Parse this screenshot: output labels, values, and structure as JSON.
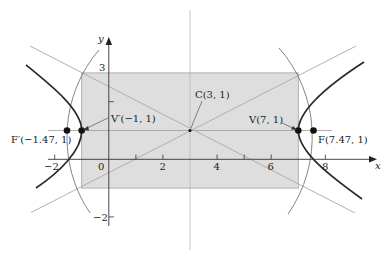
{
  "figure": {
    "type": "hyperbola-diagram",
    "equation_parameters": {
      "center": [
        3,
        1
      ],
      "a": 4,
      "b": 2,
      "c": 4.47,
      "orientation": "horizontal"
    },
    "axes": {
      "x_label": "x",
      "y_label": "y",
      "x_ticks": [
        {
          "value": -2,
          "label": "−2"
        },
        {
          "value": 0,
          "label": "0"
        },
        {
          "value": 2,
          "label": "2"
        },
        {
          "value": 4,
          "label": "4"
        },
        {
          "value": 6,
          "label": "6"
        },
        {
          "value": 8,
          "label": "8"
        }
      ],
      "y_ticks": [
        {
          "value": 3,
          "label": "3"
        },
        {
          "value": -2,
          "label": "−2"
        }
      ],
      "x_tick_marks_unlabeled": [
        1,
        5
      ],
      "y_tick_marks_unlabeled": [
        2
      ]
    },
    "points": {
      "center": {
        "label": "C(3, 1)",
        "x": 3,
        "y": 1
      },
      "vertex_right": {
        "label": "V(7, 1)",
        "x": 7,
        "y": 1
      },
      "vertex_left": {
        "label": "V′(−1, 1)",
        "x": -1,
        "y": 1
      },
      "focus_right": {
        "label": "F(7.47, 1)",
        "x": 7.47,
        "y": 1
      },
      "focus_left": {
        "label": "F′(−1.47, 1)",
        "x": -1.47,
        "y": 1
      }
    },
    "fundamental_rectangle": {
      "x_min": -1,
      "x_max": 7,
      "y_min": -1,
      "y_max": 3
    },
    "asymptote_slopes": [
      0.5,
      -0.5
    ],
    "focal_circle_radius": 4.47,
    "colors": {
      "rectangle_fill": "#dcdcdc",
      "rectangle_stroke": "#9a9a9a",
      "curve": "#2a2a2a",
      "asymptote": "#a8a8a8",
      "axis": "#333333",
      "arc": "#7a7a7a"
    }
  }
}
